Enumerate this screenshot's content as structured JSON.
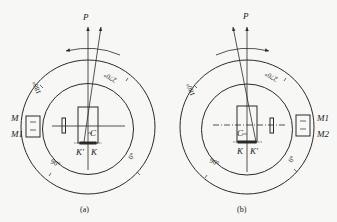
{
  "figure": {
    "stroke_color": "#2a2a2a",
    "background": "#f7f7f5",
    "panels": [
      {
        "id": "a",
        "caption": "(a)",
        "direction_label": "P",
        "rotation_arrow": "counterclockwise",
        "scale_labels": {
          "deg180": "180°",
          "deg270": "270°",
          "deg90": "90°",
          "deg0": "0°"
        },
        "mirror_labels": {
          "upper": "M",
          "lower": "M1"
        },
        "center_label": "C",
        "point_labels": {
          "left": "K'",
          "right": "K"
        }
      },
      {
        "id": "b",
        "caption": "(b)",
        "direction_label": "P",
        "rotation_arrow": "clockwise",
        "scale_labels": {
          "deg180": "180°",
          "deg270": "270°",
          "deg90": "90°",
          "deg0": "0°"
        },
        "mirror_labels": {
          "upper": "M1",
          "lower": "M2"
        },
        "center_label": "C",
        "point_labels": {
          "left": "K",
          "right": "K'"
        }
      }
    ]
  }
}
